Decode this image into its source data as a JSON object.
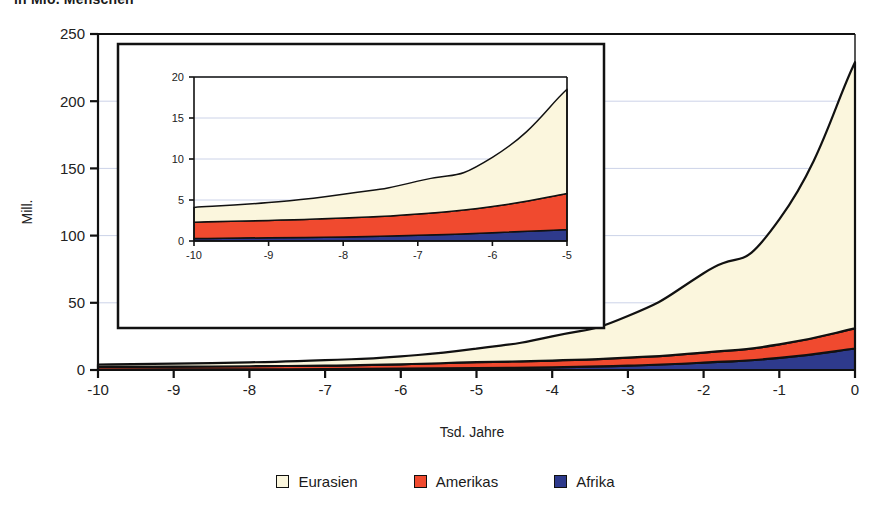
{
  "title": "in Mio. Menschen",
  "chart_data": {
    "type": "area",
    "stacked": true,
    "title": "in Mio. Menschen",
    "xlabel": "Tsd. Jahre",
    "ylabel": "Mill.",
    "xlim": [
      -10,
      0
    ],
    "ylim": [
      0,
      250
    ],
    "grid": true,
    "legend_position": "bottom",
    "x": [
      -10,
      -9,
      -8,
      -7,
      -6,
      -5,
      -4,
      -3,
      -2,
      -1,
      0
    ],
    "xticks": [
      "-10",
      "-9",
      "-8",
      "-7",
      "-6",
      "-5",
      "-4",
      "-3",
      "-2",
      "-1",
      "0"
    ],
    "yticks": [
      "0",
      "50",
      "100",
      "150",
      "200",
      "250"
    ],
    "series": [
      {
        "name": "Afrika",
        "color": "#2e3a8c",
        "values": [
          0.3,
          0.4,
          0.5,
          0.7,
          1.0,
          1.4,
          2.0,
          3.2,
          5.5,
          9.0,
          16.0
        ]
      },
      {
        "name": "Amerikas",
        "color": "#f04a2f",
        "values": [
          2.0,
          2.1,
          2.3,
          2.6,
          3.2,
          4.4,
          5.0,
          6.0,
          7.5,
          10.0,
          15.0
        ]
      },
      {
        "name": "Eurasien",
        "color": "#fbf6dd",
        "values": [
          1.8,
          2.2,
          2.9,
          4.0,
          6.0,
          10.1,
          18.0,
          31.0,
          59.0,
          93.0,
          198.0
        ]
      }
    ],
    "totals": [
      4.1,
      4.7,
      5.7,
      7.3,
      10.2,
      15.9,
      25.0,
      40.2,
      72.0,
      112.0,
      229.0
    ]
  },
  "inset": {
    "type": "area",
    "stacked": true,
    "xlim": [
      -10,
      -5
    ],
    "ylim": [
      0,
      20
    ],
    "grid": true,
    "xticks": [
      "-10",
      "-9",
      "-8",
      "-7",
      "-6",
      "-5"
    ],
    "yticks": [
      "0",
      "5",
      "10",
      "15",
      "20"
    ],
    "x": [
      -10,
      -9,
      -8,
      -7,
      -6,
      -5
    ],
    "series": [
      {
        "name": "Afrika",
        "color": "#2e3a8c",
        "values": [
          0.3,
          0.4,
          0.5,
          0.7,
          1.0,
          1.4
        ]
      },
      {
        "name": "Amerikas",
        "color": "#f04a2f",
        "values": [
          2.0,
          2.1,
          2.3,
          2.6,
          3.2,
          4.4
        ]
      },
      {
        "name": "Eurasien",
        "color": "#fbf6dd",
        "values": [
          1.8,
          2.2,
          2.9,
          4.0,
          6.0,
          12.7
        ]
      }
    ],
    "totals": [
      4.1,
      4.7,
      5.7,
      7.3,
      10.2,
      18.5
    ]
  },
  "legend": {
    "items": [
      {
        "label": "Eurasien",
        "color": "#fbf6dd"
      },
      {
        "label": "Amerikas",
        "color": "#f04a2f"
      },
      {
        "label": "Afrika",
        "color": "#2e3a8c"
      }
    ]
  },
  "colors": {
    "eurasien": "#fbf6dd",
    "amerikas": "#f04a2f",
    "afrika": "#2e3a8c",
    "axis": "#111111",
    "grid": "#ccd3e8",
    "text": "#1a1a1a",
    "background": "#ffffff"
  }
}
